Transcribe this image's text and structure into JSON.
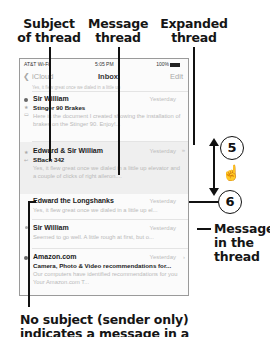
{
  "callouts": {
    "subject": "Subject of thread",
    "subject_l1": "Subject",
    "subject_l2": "of thread",
    "message_thread_l1": "Message",
    "message_thread_l2": "thread",
    "expanded_l1": "Expanded",
    "expanded_l2": "thread",
    "message_in_thread_l1": "Message",
    "message_in_thread_l2": "in the",
    "message_in_thread_l3": "thread",
    "no_subject_l1": "No subject (sender only)",
    "no_subject_l2": "indicates a message in a",
    "step5": "5",
    "step6": "6"
  },
  "status_bar": {
    "carrier": "AT&T Wi-Fi",
    "time": "5:05 PM",
    "battery": "100%"
  },
  "nav": {
    "back_label": "iCloud",
    "title": "Inbox",
    "edit_label": "Edit"
  },
  "partial_row_text": "Yes, it flew great once we dialed in a little up",
  "messages": [
    {
      "sender": "Sir William",
      "date": "Yesterday",
      "subject": "Stinger 90 Brakes",
      "preview": "Here is the document I created showing the installation of brakes on the Stinger 90. Enjoy!..."
    },
    {
      "sender": "Edward & Sir William",
      "date": "Yesterday",
      "subject": "SBach 342",
      "preview": "Yes, it flew great once we dialed in a little up elevator and a couple of clicks of right aileron...."
    },
    {
      "sender": "Edward the Longshanks",
      "date": "Yesterday",
      "preview": "Yes, it flew great once we dialed in a little up el..."
    },
    {
      "sender": "Sir William",
      "date": "Yesterday",
      "preview": "Seemed to go well. A little rough at first, but o..."
    },
    {
      "sender": "Amazon.com",
      "date": "Yesterday",
      "subject": "Camera, Photo & Video recommendations for...",
      "preview": "Our computers have identified recommendations for you Your Amazon.com T..."
    }
  ]
}
